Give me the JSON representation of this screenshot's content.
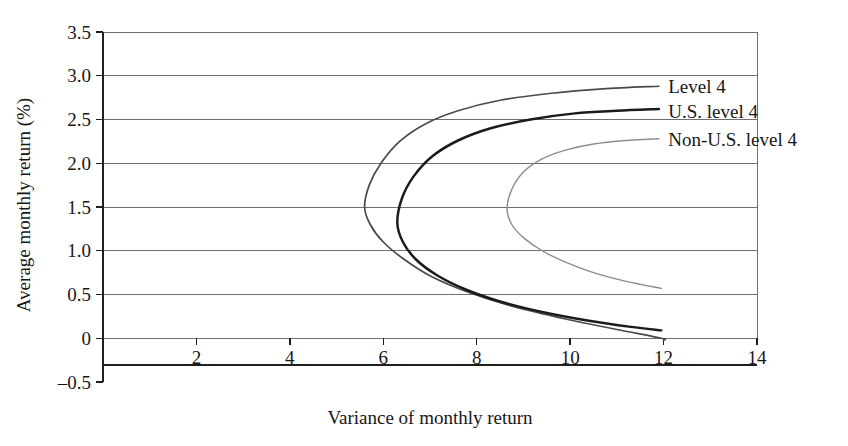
{
  "chart_data": {
    "type": "line",
    "title": "",
    "subtitle": "",
    "xlabel": "Variance of monthly return",
    "ylabel": "Average monthly return (%)",
    "xlim": [
      0,
      14
    ],
    "ylim": [
      -0.5,
      3.5
    ],
    "xticks": [
      2,
      4,
      6,
      8,
      10,
      12,
      14
    ],
    "xtick_labels": [
      "2",
      "4",
      "6",
      "8",
      "10",
      "12",
      "14"
    ],
    "yticks": [
      -0.5,
      0,
      0.5,
      1.0,
      1.5,
      2.0,
      2.5,
      3.0,
      3.5
    ],
    "ytick_labels": [
      "-0.5",
      "0",
      "0.5",
      "1.0",
      "1.5",
      "2.0",
      "2.5",
      "3.0",
      "3.5"
    ],
    "grid": "horizontal",
    "legend_position": "inline-right-of-curve-ends",
    "series": [
      {
        "name": "Level 4",
        "label": "Level 4",
        "color": "#4a4a4a",
        "line_width": 1.7,
        "vertex": [
          5.6,
          1.5
        ],
        "upper_branch": [
          [
            5.6,
            1.5
          ],
          [
            5.7,
            1.75
          ],
          [
            5.95,
            2.0
          ],
          [
            6.35,
            2.25
          ],
          [
            6.9,
            2.45
          ],
          [
            7.6,
            2.6
          ],
          [
            8.5,
            2.72
          ],
          [
            9.6,
            2.8
          ],
          [
            10.7,
            2.85
          ],
          [
            11.9,
            2.88
          ]
        ],
        "lower_branch": [
          [
            5.6,
            1.5
          ],
          [
            5.72,
            1.3
          ],
          [
            6.0,
            1.1
          ],
          [
            6.45,
            0.9
          ],
          [
            7.05,
            0.7
          ],
          [
            7.85,
            0.52
          ],
          [
            8.8,
            0.36
          ],
          [
            9.9,
            0.22
          ],
          [
            11.0,
            0.1
          ],
          [
            11.95,
            0.0
          ],
          [
            12.0,
            -0.02
          ]
        ]
      },
      {
        "name": "U.S. level 4",
        "label": "U.S. level 4",
        "color": "#1b1b1b",
        "line_width": 2.5,
        "vertex": [
          6.3,
          1.32
        ],
        "upper_branch": [
          [
            6.3,
            1.32
          ],
          [
            6.4,
            1.6
          ],
          [
            6.65,
            1.85
          ],
          [
            7.05,
            2.08
          ],
          [
            7.6,
            2.26
          ],
          [
            8.3,
            2.4
          ],
          [
            9.15,
            2.5
          ],
          [
            10.1,
            2.57
          ],
          [
            11.0,
            2.6
          ],
          [
            11.9,
            2.62
          ]
        ],
        "lower_branch": [
          [
            6.3,
            1.32
          ],
          [
            6.42,
            1.1
          ],
          [
            6.7,
            0.9
          ],
          [
            7.15,
            0.72
          ],
          [
            7.75,
            0.56
          ],
          [
            8.5,
            0.42
          ],
          [
            9.4,
            0.3
          ],
          [
            10.4,
            0.2
          ],
          [
            11.3,
            0.13
          ],
          [
            11.95,
            0.09
          ]
        ]
      },
      {
        "name": "Non-U.S. level 4",
        "label": "Non-U.S. level 4",
        "color": "#8d8d8d",
        "line_width": 1.4,
        "vertex": [
          8.65,
          1.48
        ],
        "upper_branch": [
          [
            8.65,
            1.48
          ],
          [
            8.75,
            1.7
          ],
          [
            9.0,
            1.9
          ],
          [
            9.4,
            2.05
          ],
          [
            9.9,
            2.15
          ],
          [
            10.5,
            2.22
          ],
          [
            11.2,
            2.26
          ],
          [
            11.9,
            2.28
          ]
        ],
        "lower_branch": [
          [
            8.65,
            1.48
          ],
          [
            8.75,
            1.3
          ],
          [
            9.0,
            1.15
          ],
          [
            9.4,
            1.0
          ],
          [
            9.9,
            0.87
          ],
          [
            10.5,
            0.75
          ],
          [
            11.2,
            0.65
          ],
          [
            11.95,
            0.57
          ]
        ]
      }
    ],
    "annotations": [
      {
        "text": "Level 4",
        "x": 12.1,
        "y": 2.88
      },
      {
        "text": "U.S. level 4",
        "x": 12.1,
        "y": 2.6
      },
      {
        "text": "Non-U.S. level 4",
        "x": 12.1,
        "y": 2.28
      }
    ]
  }
}
